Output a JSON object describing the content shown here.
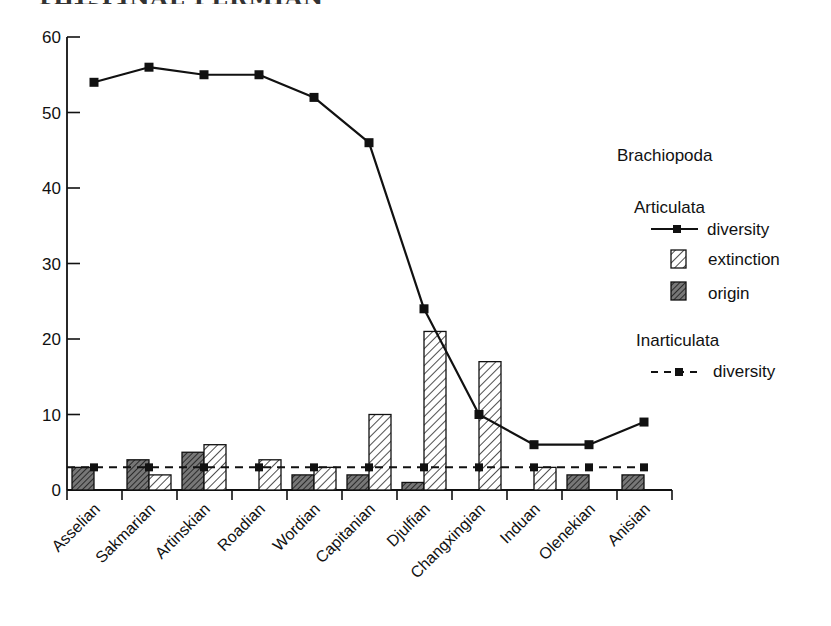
{
  "header": {
    "cut_title": "THE FINAL PERMIAN CRISIS"
  },
  "legend": {
    "title": "Brachiopoda",
    "group1": "Articulata",
    "item_diversity": "diversity",
    "item_extinction": "extinction",
    "item_origin": "origin",
    "group2": "Inarticulata",
    "item_inart_diversity": "diversity"
  },
  "axis": {
    "y_ticks": [
      "0",
      "10",
      "20",
      "30",
      "40",
      "50",
      "60"
    ]
  },
  "chart_data": {
    "type": "bar",
    "title": "Brachiopoda",
    "xlabel": "",
    "ylabel": "",
    "ylim": [
      0,
      60
    ],
    "yticks": [
      0,
      10,
      20,
      30,
      40,
      50,
      60
    ],
    "grid": false,
    "legend_position": "right",
    "categories": [
      "Asselian",
      "Sakmarian",
      "Artinskian",
      "Roadian",
      "Wordian",
      "Capitanian",
      "Djulfian",
      "Changxingian",
      "Induan",
      "Olenekian",
      "Anisian"
    ],
    "series": [
      {
        "name": "Articulata diversity",
        "type": "line",
        "style": "solid",
        "values": [
          54,
          56,
          55,
          55,
          52,
          46,
          24,
          10,
          6,
          6,
          9
        ]
      },
      {
        "name": "Articulata extinction",
        "type": "bar",
        "pattern": "light-hatch",
        "values": [
          0,
          2,
          6,
          4,
          3,
          10,
          21,
          17,
          3,
          0,
          0
        ]
      },
      {
        "name": "Articulata origin",
        "type": "bar",
        "pattern": "dark-hatch",
        "values": [
          3,
          4,
          5,
          0,
          2,
          2,
          1,
          0,
          0,
          2,
          2
        ]
      },
      {
        "name": "Inarticulata diversity",
        "type": "line",
        "style": "dashed",
        "values": [
          3,
          3,
          3,
          3,
          3,
          3,
          3,
          3,
          3,
          3,
          3
        ]
      }
    ]
  }
}
